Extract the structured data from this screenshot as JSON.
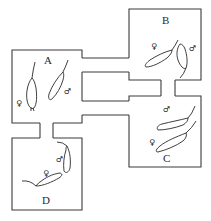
{
  "diagram": {
    "cages": [
      {
        "id": "A",
        "label": "A",
        "occupants": [
          {
            "sex": "female",
            "symbol": "♀"
          },
          {
            "sex": "male",
            "symbol": "♂"
          }
        ]
      },
      {
        "id": "B",
        "label": "B",
        "occupants": [
          {
            "sex": "female",
            "symbol": "♀"
          },
          {
            "sex": "male",
            "symbol": "♂"
          }
        ]
      },
      {
        "id": "C",
        "label": "C",
        "occupants": [
          {
            "sex": "male",
            "symbol": "♂"
          },
          {
            "sex": "female",
            "symbol": "♀"
          }
        ]
      },
      {
        "id": "D",
        "label": "D",
        "occupants": [
          {
            "sex": "male",
            "symbol": "♂"
          },
          {
            "sex": "female",
            "symbol": "♀"
          }
        ]
      }
    ],
    "connections": [
      {
        "from": "A",
        "to": "B",
        "type": "tube"
      },
      {
        "from": "A",
        "to": "C",
        "type": "tube"
      },
      {
        "from": "B",
        "to": "C",
        "type": "tube"
      },
      {
        "from": "A",
        "to": "D",
        "type": "tube"
      }
    ],
    "colors": {
      "line": "#3a3a3a",
      "background": "#ffffff"
    }
  }
}
